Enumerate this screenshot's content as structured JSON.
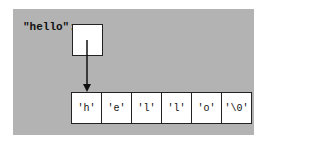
{
  "diagram": {
    "variable_label": "\"hello\":",
    "cells": [
      "'h'",
      "'e'",
      "'l'",
      "'l'",
      "'o'",
      "'\\0'"
    ],
    "colors": {
      "panel": "#b3b3b3",
      "box": "#ffffff",
      "stroke": "#222222"
    }
  }
}
